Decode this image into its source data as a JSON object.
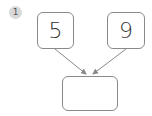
{
  "problem": {
    "number": "1",
    "left_value": "5",
    "right_value": "9",
    "result_value": ""
  },
  "colors": {
    "badge_bg": "#d9d9d9",
    "box_border": "#8a8a8a",
    "arrow": "#888888"
  }
}
